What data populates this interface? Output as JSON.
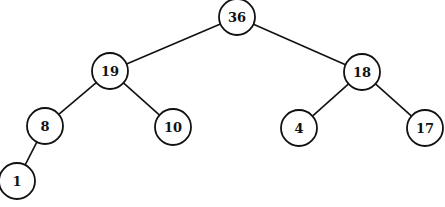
{
  "diagram": {
    "type": "binary-tree (max-heap)",
    "colors": {
      "stroke": "#111111",
      "fill": "#ffffff",
      "text": "#111111"
    },
    "radius": 18,
    "nodes": [
      {
        "id": "n36",
        "label": "36",
        "x": 237,
        "y": 17
      },
      {
        "id": "n19",
        "label": "19",
        "x": 110,
        "y": 71
      },
      {
        "id": "n18",
        "label": "18",
        "x": 362,
        "y": 72
      },
      {
        "id": "n8",
        "label": "8",
        "x": 45,
        "y": 126
      },
      {
        "id": "n10",
        "label": "10",
        "x": 173,
        "y": 127
      },
      {
        "id": "n4",
        "label": "4",
        "x": 299,
        "y": 128
      },
      {
        "id": "n17",
        "label": "17",
        "x": 425,
        "y": 128
      },
      {
        "id": "n1",
        "label": "1",
        "x": 17,
        "y": 181
      }
    ],
    "edges": [
      {
        "from": "n36",
        "to": "n19"
      },
      {
        "from": "n36",
        "to": "n18"
      },
      {
        "from": "n19",
        "to": "n8"
      },
      {
        "from": "n19",
        "to": "n10"
      },
      {
        "from": "n18",
        "to": "n4"
      },
      {
        "from": "n18",
        "to": "n17"
      },
      {
        "from": "n8",
        "to": "n1"
      }
    ]
  }
}
